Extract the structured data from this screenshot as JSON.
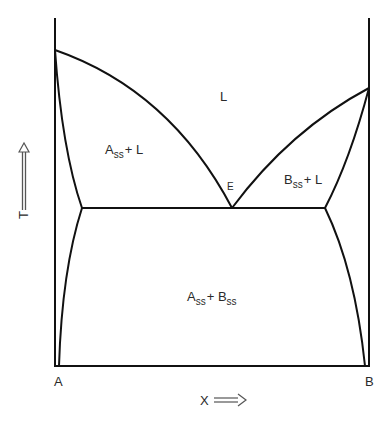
{
  "diagram": {
    "type": "binary eutectic phase diagram",
    "components": {
      "left": "A",
      "right": "B"
    },
    "axes": {
      "y_label": "T",
      "x_label": "X"
    },
    "regions": [
      {
        "id": "liquid",
        "label": "L"
      },
      {
        "id": "alpha_plus_liquid",
        "base": "A",
        "sub": "ss",
        "suffix": "+ L"
      },
      {
        "id": "beta_plus_liquid",
        "base": "B",
        "sub": "ss",
        "suffix": "+ L"
      },
      {
        "id": "alpha_plus_beta",
        "base": "A",
        "sub": "ss",
        "mid": "+ B",
        "sub2": "ss"
      }
    ],
    "points": {
      "eutectic": "E"
    },
    "colors": {
      "line": "#111111",
      "text": "#2a2a2a",
      "background": "#ffffff"
    }
  }
}
